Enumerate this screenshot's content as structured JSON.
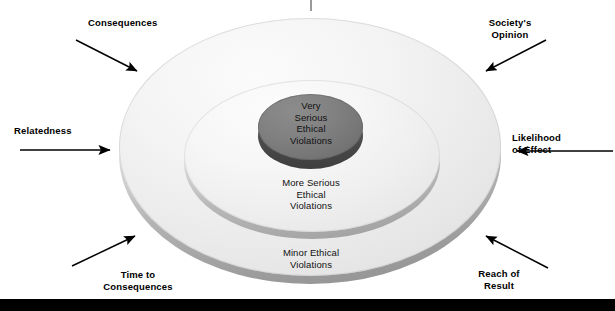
{
  "diagram": {
    "title_tick": "",
    "rings": [
      {
        "id": "outer",
        "label": "Minor Ethical\nViolations",
        "fill": "#f2f2f2",
        "rim": "#a8a8a8"
      },
      {
        "id": "middle",
        "label": "More Serious\nEthical\nViolations",
        "fill": "#f6f6f6",
        "rim": "#b0b0b0"
      },
      {
        "id": "inner",
        "label": "Very\nSerious\nEthical\nViolations",
        "fill": "#7b7b7b",
        "rim": "#4a4a4a"
      }
    ],
    "callouts": [
      {
        "id": "consequences",
        "label": "Consequences",
        "arrow": "down-right"
      },
      {
        "id": "societys-opinion",
        "label": "Society's\nOpinion",
        "arrow": "down-left"
      },
      {
        "id": "relatedness",
        "label": "Relatedness",
        "arrow": "right"
      },
      {
        "id": "likelihood",
        "label": "Likelihood\nof Effect",
        "arrow": "left"
      },
      {
        "id": "time-to-consequences",
        "label": "Time to\nConsequences",
        "arrow": "up-right"
      },
      {
        "id": "reach-of-result",
        "label": "Reach of\nResult",
        "arrow": "up-left"
      }
    ],
    "colors": {
      "arrow": "#000000",
      "text": "#000000",
      "ring_text": "#111111",
      "footer_bar": "#000000",
      "tick": "#9a9a9a",
      "background": "#ffffff"
    }
  }
}
